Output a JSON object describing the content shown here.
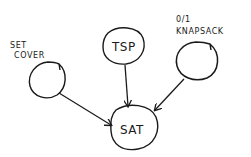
{
  "diagram": {
    "type": "reduction-graph",
    "stroke_color": "#1a1a1a",
    "background": "#ffffff",
    "nodes": [
      {
        "id": "set_cover",
        "label_lines": [
          "SET",
          "COVER"
        ],
        "inside_text": ""
      },
      {
        "id": "tsp",
        "label_lines": [],
        "inside_text": "TSP"
      },
      {
        "id": "knapsack",
        "label_lines": [
          "0/1",
          "KNAPSACK"
        ],
        "inside_text": ""
      },
      {
        "id": "sat",
        "label_lines": [],
        "inside_text": "SAT"
      }
    ],
    "edges": [
      {
        "from": "set_cover",
        "to": "sat"
      },
      {
        "from": "tsp",
        "to": "sat"
      },
      {
        "from": "knapsack",
        "to": "sat"
      }
    ]
  }
}
